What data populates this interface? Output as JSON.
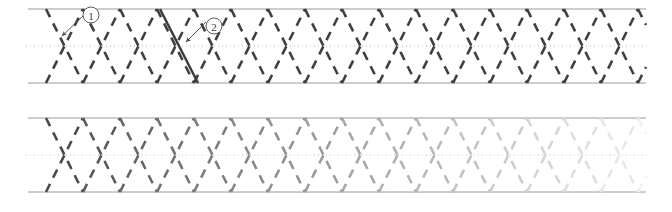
{
  "figure": {
    "title": "",
    "width": 672,
    "height": 212,
    "background": "#ffffff"
  },
  "colors": {
    "rail_line": "#9a9a9a",
    "center_dotted": "#b8b8b8",
    "zigzag_dark": "#3f3f46",
    "solid_highlight": "#3a3a3a",
    "annotation": "#4a4a4a",
    "annotation_circle_fill": "#ffffff"
  },
  "panels": [
    {
      "id": "panel-top",
      "name": "uniform-zigzag-band",
      "top_y": 9,
      "center_y": 46,
      "bottom_y": 83,
      "x_start": 28,
      "x_end": 646,
      "period": 74,
      "zigzag_dash": "9 7",
      "zigzag_width": 2.6,
      "fade": false,
      "vertex_color": "#3f3f46"
    },
    {
      "id": "panel-bottom",
      "name": "fading-zigzag-band",
      "top_y": 118,
      "center_y": 155,
      "bottom_y": 192,
      "x_start": 28,
      "x_end": 646,
      "period": 74,
      "zigzag_dash": "9 7",
      "zigzag_width": 2.6,
      "fade": true,
      "fade_from": "#3f3f46",
      "fade_to": "#f2f2f2",
      "vertex_color": "#3f3f46"
    }
  ],
  "solid_highlight_segment": {
    "name": "solid-diagonal-stroke",
    "x1": 160,
    "y1": 9,
    "x2": 198,
    "y2": 83,
    "color": "#3a3a3a",
    "width": 2.4
  },
  "annotations": [
    {
      "id": "annotation-1",
      "label": "1",
      "circle_cx": 91,
      "circle_cy": 15,
      "circle_r": 8,
      "arrow_x1": 83,
      "arrow_y1": 16,
      "arrow_x2": 62,
      "arrow_y2": 36
    },
    {
      "id": "annotation-2",
      "label": "2",
      "circle_cx": 214,
      "circle_cy": 26,
      "circle_r": 8,
      "arrow_x1": 206,
      "arrow_y1": 22,
      "arrow_x2": 186,
      "arrow_y2": 42
    }
  ],
  "chart_data": {
    "type": "line",
    "title": "",
    "xlabel": "",
    "ylabel": "",
    "grid": false,
    "legend": "none",
    "series": [
      {
        "name": "uniform-zigzag",
        "panel": "panel-top",
        "period": 74,
        "amplitude": 37,
        "opacity_profile": "constant",
        "opacity_values": [
          1,
          1,
          1,
          1,
          1,
          1,
          1,
          1,
          1
        ]
      },
      {
        "name": "fading-zigzag",
        "panel": "panel-bottom",
        "period": 74,
        "amplitude": 37,
        "opacity_profile": "linear-decay",
        "opacity_values": [
          1.0,
          0.88,
          0.7,
          0.54,
          0.4,
          0.28,
          0.19,
          0.12,
          0.07
        ]
      }
    ],
    "x": [
      28,
      65,
      102,
      139,
      176,
      213,
      250,
      287,
      324,
      361,
      398,
      435,
      472,
      509,
      546,
      583,
      620,
      646
    ],
    "axis_ranges": {
      "x": [
        28,
        646
      ],
      "y_panel_top": [
        9,
        83
      ],
      "y_panel_bottom": [
        118,
        192
      ]
    }
  }
}
